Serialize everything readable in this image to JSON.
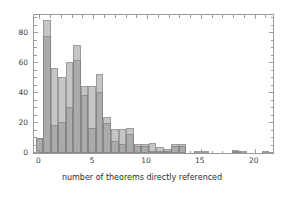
{
  "figure": {
    "top_fragment": "",
    "frame_color": "#9a9a9a",
    "bar_fill": "#969696",
    "bar_edge": "#787878"
  },
  "chart_data": {
    "type": "bar",
    "title": "",
    "subtitle": "",
    "xlabel": "number of theorems directly referenced",
    "ylabel": "",
    "xlim": [
      -0.5,
      21.7
    ],
    "ylim": [
      0,
      92
    ],
    "xticks": [
      0,
      5,
      10,
      15,
      20
    ],
    "xticklabels": [
      "0",
      "5",
      "10",
      "15",
      "20"
    ],
    "yticks": [
      0,
      20,
      40,
      60,
      80
    ],
    "yticklabels": [
      "0",
      "20",
      "40",
      "60",
      "80"
    ],
    "grid": false,
    "legend": "none",
    "bin_width": 0.7,
    "orientation": "vertical",
    "overlap": "semi-transparent overlaid histograms",
    "series": [
      {
        "name": "series-1",
        "color": "#969696",
        "opacity": 0.55,
        "x": [
          -0.35,
          0.35,
          1.05,
          1.75,
          2.45,
          3.15,
          3.85,
          4.55,
          5.25,
          5.95,
          6.65,
          7.35,
          8.05,
          8.75,
          9.45,
          10.15,
          10.85,
          11.55,
          12.25,
          12.95,
          14.35,
          15.05,
          17.85,
          18.55,
          20.65,
          21.0
        ],
        "values": [
          10,
          89,
          57,
          51,
          61,
          72,
          45,
          53,
          24,
          16,
          17,
          6,
          6,
          3,
          5,
          0,
          0,
          1,
          1,
          0,
          2,
          0,
          0,
          0,
          0,
          0
        ]
      },
      {
        "name": "series-2",
        "color": "#969696",
        "opacity": 0.55,
        "x": [
          -0.35,
          0.35,
          1.05,
          1.75,
          2.45,
          3.15,
          3.85,
          4.55,
          5.25,
          5.95,
          6.65,
          7.35,
          8.05,
          8.75,
          9.45,
          10.15,
          10.85,
          11.55,
          12.25,
          12.95,
          14.35,
          15.05,
          17.85,
          18.55,
          20.65,
          21.0
        ],
        "values": [
          10,
          78,
          19,
          21,
          31,
          62,
          39,
          41,
          20,
          8,
          13,
          5,
          5,
          1,
          5,
          0,
          0,
          1,
          1,
          0,
          2,
          0,
          0,
          0,
          0,
          0
        ]
      }
    ],
    "bars": [
      {
        "x": -0.35,
        "w": 0.7,
        "outer": 10,
        "inner": 10
      },
      {
        "x": 0.35,
        "w": 0.7,
        "outer": 89,
        "inner": 78
      },
      {
        "x": 1.05,
        "w": 0.7,
        "outer": 57,
        "inner": 19
      },
      {
        "x": 1.75,
        "w": 0.7,
        "outer": 51,
        "inner": 21
      },
      {
        "x": 2.45,
        "w": 0.7,
        "outer": 61,
        "inner": 31
      },
      {
        "x": 3.15,
        "w": 0.7,
        "outer": 72,
        "inner": 62
      },
      {
        "x": 3.85,
        "w": 0.7,
        "outer": 45,
        "inner": 39
      },
      {
        "x": 4.55,
        "w": 0.7,
        "outer": 45,
        "inner": 17
      },
      {
        "x": 5.25,
        "w": 0.7,
        "outer": 53,
        "inner": 41
      },
      {
        "x": 5.95,
        "w": 0.7,
        "outer": 24,
        "inner": 20
      },
      {
        "x": 6.65,
        "w": 0.7,
        "outer": 16,
        "inner": 8
      },
      {
        "x": 7.35,
        "w": 0.7,
        "outer": 16,
        "inner": 6
      },
      {
        "x": 8.05,
        "w": 0.7,
        "outer": 17,
        "inner": 13
      },
      {
        "x": 8.75,
        "w": 0.7,
        "outer": 6,
        "inner": 5
      },
      {
        "x": 9.45,
        "w": 0.7,
        "outer": 6,
        "inner": 5
      },
      {
        "x": 10.15,
        "w": 0.7,
        "outer": 7,
        "inner": 1
      },
      {
        "x": 10.85,
        "w": 0.7,
        "outer": 4,
        "inner": 1
      },
      {
        "x": 11.55,
        "w": 0.7,
        "outer": 3,
        "inner": 1
      },
      {
        "x": 12.25,
        "w": 0.7,
        "outer": 6,
        "inner": 5
      },
      {
        "x": 12.95,
        "w": 0.7,
        "outer": 6,
        "inner": 5
      },
      {
        "x": 14.35,
        "w": 0.7,
        "outer": 1,
        "inner": 0
      },
      {
        "x": 15.05,
        "w": 0.7,
        "outer": 1,
        "inner": 0
      },
      {
        "x": 17.85,
        "w": 0.7,
        "outer": 2,
        "inner": 1
      },
      {
        "x": 18.55,
        "w": 0.7,
        "outer": 1,
        "inner": 0
      },
      {
        "x": 20.65,
        "w": 0.7,
        "outer": 1,
        "inner": 0
      }
    ]
  }
}
